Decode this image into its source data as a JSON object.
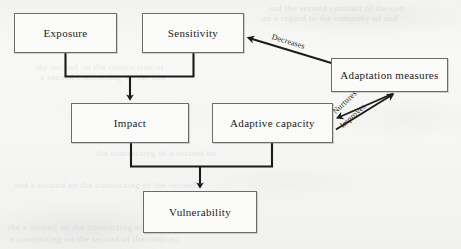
{
  "figure": {
    "background_color": "#f5f5f3",
    "line_color": "#1b1b1b",
    "box_border_color": "#6b6b6b",
    "box_fill_color": "#fbfbfa"
  },
  "nodes": [
    {
      "id": "exposure",
      "label": "Exposure",
      "x": 14,
      "y": 13,
      "w": 103,
      "h": 40
    },
    {
      "id": "sensitivity",
      "label": "Sensitivity",
      "x": 142,
      "y": 13,
      "w": 102,
      "h": 40
    },
    {
      "id": "adaptation_measures",
      "label": "Adaptation measures",
      "x": 331,
      "y": 58,
      "w": 117,
      "h": 34
    },
    {
      "id": "impact",
      "label": "Impact",
      "x": 71,
      "y": 103,
      "w": 118,
      "h": 40
    },
    {
      "id": "adaptive_capacity",
      "label": "Adaptive capacity",
      "x": 212,
      "y": 103,
      "w": 121,
      "h": 40
    },
    {
      "id": "vulnerability",
      "label": "Vulnerability",
      "x": 143,
      "y": 191,
      "w": 114,
      "h": 42
    }
  ],
  "edges": [
    {
      "id": "exposure-sensitivity-to-impact",
      "from": "exposure, sensitivity",
      "to": "impact",
      "label": "",
      "style": "bracket-down"
    },
    {
      "id": "impact-capacity-to-vulnerability",
      "from": "impact, adaptive capacity",
      "to": "vulnerability",
      "label": "",
      "style": "bracket-down"
    },
    {
      "id": "adaptation-decreases-sensitivity",
      "from": "adaptation measures",
      "to": "sensitivity",
      "label": "Decreases",
      "style": "diagonal-arrow"
    },
    {
      "id": "adaptation-nurtures-capacity",
      "from": "adaptation measures",
      "to": "adaptive capacity",
      "label": "Nurtures",
      "style": "diagonal-arrow"
    },
    {
      "id": "capacity-improves-adaptation",
      "from": "adaptive capacity",
      "to": "adaptation measures",
      "label": "Improves",
      "style": "diagonal-arrow"
    }
  ],
  "edge_labels": {
    "decreases": {
      "text": "Decreases",
      "x": 272,
      "y": 32,
      "rotation": 17
    },
    "nurtures": {
      "text": "Nurtures",
      "x": 334,
      "y": 108,
      "rotation": -44
    },
    "improves": {
      "text": "Improves",
      "x": 341,
      "y": 122,
      "rotation": -42
    }
  },
  "ghost_text": [
    {
      "text": "and the second contract of the con",
      "x": 268,
      "y": 3,
      "size": 9
    },
    {
      "text": "an a regard to the company of and",
      "x": 262,
      "y": 13,
      "size": 9
    },
    {
      "text": "the second on the  contraction of",
      "x": 36,
      "y": 62,
      "size": 9
    },
    {
      "text": "a second contracting on the con",
      "x": 40,
      "y": 72,
      "size": 9
    },
    {
      "text": "the contracting of a second on",
      "x": 96,
      "y": 148,
      "size": 9
    },
    {
      "text": "and a second on the contracting of the second",
      "x": 14,
      "y": 180,
      "size": 9
    },
    {
      "text": "the  a second on the contracting of the second",
      "x": 8,
      "y": 222,
      "size": 9
    },
    {
      "text": "a contracting on the second of the contract",
      "x": 10,
      "y": 234,
      "size": 9
    }
  ]
}
